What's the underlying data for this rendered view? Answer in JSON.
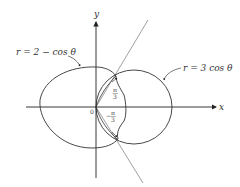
{
  "figure": {
    "axes": {
      "x_label": "x",
      "y_label": "y",
      "origin_label": "0"
    },
    "curves": [
      {
        "name": "limacon",
        "equation": "r = 2 − cos θ"
      },
      {
        "name": "circle",
        "equation": "r = 3 cos θ"
      }
    ],
    "angles": [
      {
        "label_num": "π",
        "label_den": "3",
        "sign": ""
      },
      {
        "label_num": "π",
        "label_den": "3",
        "sign": "−"
      }
    ],
    "colors": {
      "curve": "#333333",
      "ray": "#777777",
      "axis": "#222222"
    }
  }
}
